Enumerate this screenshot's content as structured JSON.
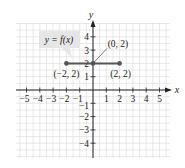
{
  "chart_data": {
    "type": "line",
    "title": "",
    "function_label": "y = f(x)",
    "xlabel": "x",
    "ylabel": "y",
    "xlim": [
      -5,
      5
    ],
    "ylim": [
      -4,
      4
    ],
    "grid": true,
    "x_ticks": [
      -5,
      -4,
      -3,
      -2,
      -1,
      1,
      2,
      3,
      4,
      5
    ],
    "y_ticks": [
      -4,
      -3,
      -2,
      -1,
      1,
      2,
      3,
      4
    ],
    "x_tick_labels": [
      "−5",
      "−4",
      "−3",
      "−2",
      "−1",
      "1",
      "2",
      "3",
      "4",
      "5"
    ],
    "y_tick_labels": [
      "−4",
      "−3",
      "−2",
      "−1",
      "1",
      "2",
      "3",
      "4"
    ],
    "series": [
      {
        "name": "y = f(x)",
        "x": [
          -2,
          0,
          2
        ],
        "y": [
          2,
          2,
          2
        ]
      }
    ],
    "points": [
      {
        "x": -2,
        "y": 2,
        "label": "(−2, 2)"
      },
      {
        "x": 0,
        "y": 2,
        "label": "(0, 2)"
      },
      {
        "x": 2,
        "y": 2,
        "label": "(2, 2)"
      }
    ],
    "colors": {
      "line": "#555555",
      "grid": "#d8d8d8",
      "axis": "#222222",
      "label_box": "#e6e6e6"
    }
  }
}
